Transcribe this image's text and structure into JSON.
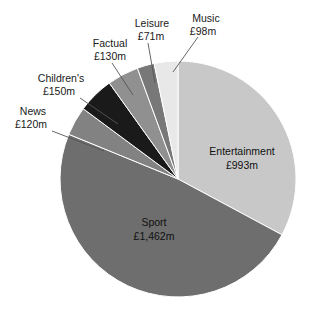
{
  "chart_data": {
    "type": "pie",
    "title": "",
    "subtitle": "",
    "xlabel": "",
    "ylabel": "",
    "units": "£m",
    "legend_position": "none",
    "grid": false,
    "total": 3024,
    "categories": [
      "Entertainment",
      "Sport",
      "News",
      "Children's",
      "Factual",
      "Leisure",
      "Music"
    ],
    "values": [
      993,
      1462,
      120,
      150,
      130,
      71,
      98
    ],
    "value_labels": [
      "£993m",
      "£1,462m",
      "£120m",
      "£150m",
      "£130m",
      "£71m",
      "£98m"
    ],
    "colors": [
      "#c8c8c8",
      "#6e6e6e",
      "#828282",
      "#1a1a1a",
      "#909090",
      "#787878",
      "#e8e8e8"
    ],
    "start_angle_deg": 0,
    "direction": "clockwise",
    "slices": [
      {
        "name": "Entertainment",
        "value": 993,
        "label": "Entertainment",
        "value_label": "£993m",
        "color": "#c8c8c8",
        "label_placement": "inside"
      },
      {
        "name": "Sport",
        "value": 1462,
        "label": "Sport",
        "value_label": "£1,462m",
        "color": "#6e6e6e",
        "label_placement": "inside"
      },
      {
        "name": "News",
        "value": 120,
        "label": "News",
        "value_label": "£120m",
        "color": "#828282",
        "label_placement": "callout"
      },
      {
        "name": "Children's",
        "value": 150,
        "label": "Children's",
        "value_label": "£150m",
        "color": "#1a1a1a",
        "label_placement": "callout"
      },
      {
        "name": "Factual",
        "value": 130,
        "label": "Factual",
        "value_label": "£130m",
        "color": "#909090",
        "label_placement": "callout"
      },
      {
        "name": "Leisure",
        "value": 71,
        "label": "Leisure",
        "value_label": "£71m",
        "color": "#787878",
        "label_placement": "callout"
      },
      {
        "name": "Music",
        "value": 98,
        "label": "Music",
        "value_label": "£98m",
        "color": "#e8e8e8",
        "label_placement": "callout"
      }
    ]
  },
  "labels": {
    "entertainment_name": "Entertainment",
    "entertainment_value": "£993m",
    "sport_name": "Sport",
    "sport_value": "£1,462m",
    "news_name": "News",
    "news_value": "£120m",
    "childrens_name": "Children's",
    "childrens_value": "£150m",
    "factual_name": "Factual",
    "factual_value": "£130m",
    "leisure_name": "Leisure",
    "leisure_value": "£71m",
    "music_name": "Music",
    "music_value": "£98m"
  }
}
